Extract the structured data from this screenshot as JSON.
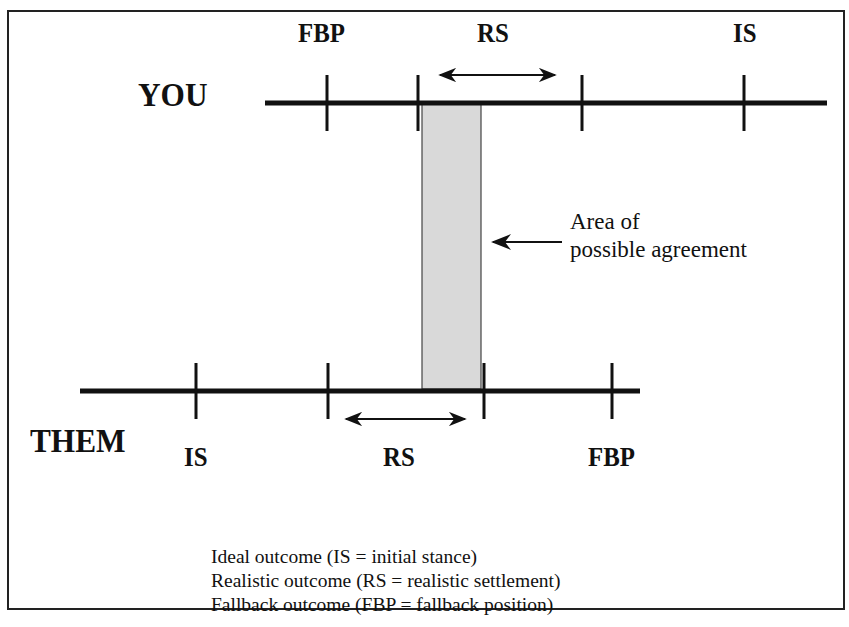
{
  "diagram": {
    "title_cutoff": "",
    "you": {
      "party_label": "YOU",
      "markers": [
        {
          "label": "FBP",
          "name": "fallback-position"
        },
        {
          "label": "RS",
          "name": "realistic-settlement"
        },
        {
          "label": "IS",
          "name": "initial-stance"
        }
      ]
    },
    "them": {
      "party_label": "THEM",
      "markers": [
        {
          "label": "IS",
          "name": "initial-stance"
        },
        {
          "label": "RS",
          "name": "realistic-settlement"
        },
        {
          "label": "FBP",
          "name": "fallback-position"
        }
      ]
    },
    "agreement_area": {
      "label_line1": "Area of",
      "label_line2": "possible agreement",
      "fill_color": "#d9d9d9"
    },
    "legend": [
      "Ideal outcome (IS = initial stance)",
      "Realistic outcome (RS = realistic settlement)",
      "Fallback outcome (FBP = fallback position)"
    ]
  }
}
